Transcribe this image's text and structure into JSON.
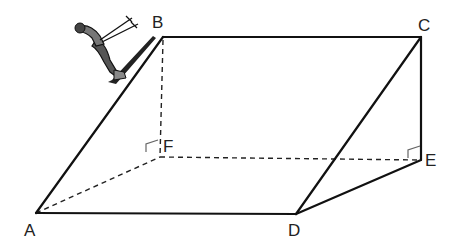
{
  "figure": {
    "colors": {
      "line": "#111111",
      "dashed": "#222222",
      "marker": "#666666",
      "background": "#ffffff"
    },
    "vertices": {
      "A": {
        "label": "A",
        "x": 36,
        "y": 213
      },
      "B": {
        "label": "B",
        "x": 163,
        "y": 37
      },
      "C": {
        "label": "C",
        "x": 421,
        "y": 37
      },
      "D": {
        "label": "D",
        "x": 296,
        "y": 214
      },
      "E": {
        "label": "E",
        "x": 421,
        "y": 160
      },
      "F": {
        "label": "F",
        "x": 160,
        "y": 157
      }
    },
    "solid_edges": [
      "AB",
      "BC",
      "AD",
      "DC",
      "CE",
      "DE"
    ],
    "hidden_edges": [
      "BF",
      "AF",
      "FE"
    ],
    "right_angles": [
      "F",
      "E"
    ],
    "icons": [
      "skier-icon"
    ]
  }
}
